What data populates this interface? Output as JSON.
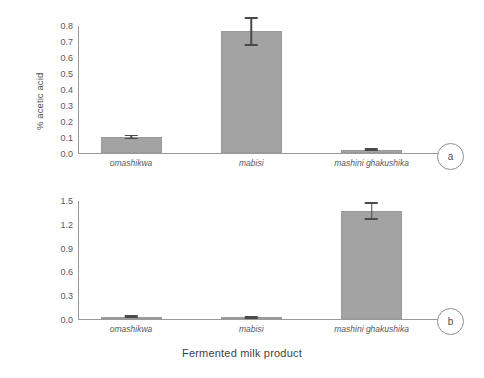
{
  "figure": {
    "xaxis_title": "Fermented milk product",
    "background": "#ffffff",
    "bar_color": "#a3a3a3",
    "axis_color": "#9a9a9a",
    "error_bar_color": "#4a4a4a"
  },
  "panels": [
    {
      "id": "a",
      "badge_label": "a",
      "ylabel": "% acetic acid",
      "yticks": [
        "0.8",
        "0.7",
        "0.6",
        "0.5",
        "0.4",
        "0.3",
        "0.2",
        "0.1",
        "0.0"
      ],
      "xticks": [
        "omashikwa",
        "mabisi",
        "mashini ghakushika"
      ]
    },
    {
      "id": "b",
      "badge_label": "b",
      "ylabel": "% lactic acid",
      "yticks": [
        "1.5",
        "1.2",
        "0.9",
        "0.6",
        "0.3",
        "0.0"
      ],
      "xticks": [
        "omashikwa",
        "mabisi",
        "mashini ghakushika"
      ]
    }
  ],
  "chart_data": [
    {
      "type": "bar",
      "panel": "a",
      "title": "",
      "xlabel": "Fermented milk product",
      "ylabel": "% acetic acid",
      "ylim": [
        0.0,
        0.8
      ],
      "ytick_values": [
        0.0,
        0.1,
        0.2,
        0.3,
        0.4,
        0.5,
        0.6,
        0.7,
        0.8
      ],
      "grid": false,
      "legend": "none",
      "categories": [
        "omashikwa",
        "mabisi",
        "mashini ghakushika"
      ],
      "values": [
        0.1,
        0.76,
        0.02
      ],
      "errors": [
        0.015,
        0.09,
        0.005
      ]
    },
    {
      "type": "bar",
      "panel": "b",
      "title": "",
      "xlabel": "Fermented milk product",
      "ylabel": "% lactic acid",
      "ylim": [
        0.0,
        1.5
      ],
      "ytick_values": [
        0.0,
        0.3,
        0.6,
        0.9,
        1.2,
        1.5
      ],
      "grid": false,
      "legend": "none",
      "categories": [
        "omashikwa",
        "mabisi",
        "mashini ghakushika"
      ],
      "values": [
        0.025,
        0.012,
        1.36
      ],
      "errors": [
        0.012,
        0.006,
        0.11
      ]
    }
  ]
}
